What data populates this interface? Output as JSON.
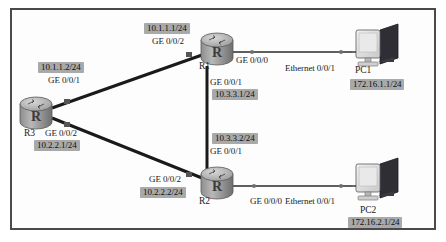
{
  "diagram": {
    "background_color": "#ffffff",
    "border_color": "#4a4a4a",
    "highlight_color": "#a9a9a9",
    "link_color": "#1a1a1a"
  },
  "devices": {
    "r1": {
      "name": "R1",
      "type": "router-icon",
      "glyph": "R"
    },
    "r2": {
      "name": "R2",
      "type": "router-icon",
      "glyph": "R"
    },
    "r3": {
      "name": "R3",
      "type": "router-icon",
      "glyph": "R"
    },
    "pc1": {
      "name": "PC1",
      "type": "pc-icon"
    },
    "pc2": {
      "name": "PC2",
      "type": "pc-icon"
    }
  },
  "labels": {
    "r1_ge002_ip": "10.1.1.1/24",
    "r1_ge002_if": "GE 0/0/2",
    "r3_ge001_ip": "10.1.1.2/24",
    "r3_ge001_if": "GE 0/0/1",
    "r3_ge002_if": "GE 0/0/2",
    "r3_ge002_ip": "10.2.2.1/24",
    "r1_ge000_if": "GE 0/0/0",
    "r1_ge001_if": "GE 0/0/1",
    "r1_ge001_ip": "10.3.3.1/24",
    "r2_ge001_ip": "10.3.3.2/24",
    "r2_ge001_if": "GE 0/0/1",
    "r2_ge002_if": "GE 0/0/2",
    "r2_ge002_ip": "10.2.2.2/24",
    "r2_ge000_if": "GE 0/0/0",
    "pc1_if": "Ethernet 0/0/1",
    "pc1_ip": "172.16.1.1/24",
    "pc2_if": "Ethernet 0/0/1",
    "pc2_ip": "172.16.2.1/24"
  }
}
